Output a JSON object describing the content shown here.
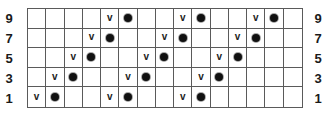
{
  "row_labels": [
    "9",
    "7",
    "5",
    "3",
    "1"
  ],
  "columns": 15,
  "symbols": {
    "v": "v",
    "dot": "dot"
  },
  "rows": [
    {
      "label": "9",
      "v_cols": [
        4,
        8,
        12
      ],
      "dot_cols": [
        5,
        9,
        13
      ]
    },
    {
      "label": "7",
      "v_cols": [
        3,
        7,
        11
      ],
      "dot_cols": [
        4,
        8,
        12
      ]
    },
    {
      "label": "5",
      "v_cols": [
        2,
        6,
        10
      ],
      "dot_cols": [
        3,
        7,
        11
      ]
    },
    {
      "label": "3",
      "v_cols": [
        1,
        5,
        9
      ],
      "dot_cols": [
        2,
        6,
        10
      ]
    },
    {
      "label": "1",
      "v_cols": [
        0,
        4,
        8
      ],
      "dot_cols": [
        1,
        5,
        9
      ]
    }
  ]
}
